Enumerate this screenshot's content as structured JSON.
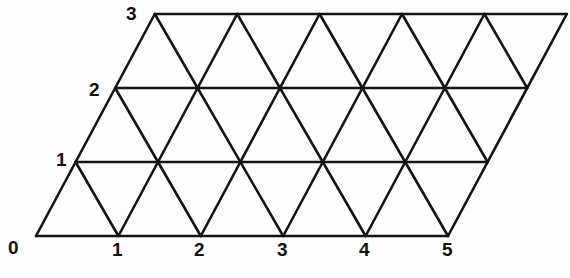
{
  "figure": {
    "name": "triangular-lattice-parallelogram",
    "stroke_color": "#141414",
    "background_color": "#fdfdfd",
    "label_color": "#111111"
  },
  "lattice": {
    "type": "triangular-grid",
    "columns": 5,
    "rows": 3,
    "origin": {
      "x": 36,
      "y": 236
    },
    "step_x": 82.4,
    "step_y": 74.0,
    "shear_x": 39.6,
    "stroke_width": 2.6
  },
  "axes": {
    "x_axis": {
      "name": "horizontal-axis",
      "ticks": [
        {
          "value": "0",
          "x": 36,
          "y": 236
        },
        {
          "value": "1",
          "x": 118,
          "y": 236
        },
        {
          "value": "2",
          "x": 201,
          "y": 236
        },
        {
          "value": "3",
          "x": 283,
          "y": 236
        },
        {
          "value": "4",
          "x": 366,
          "y": 236
        },
        {
          "value": "5",
          "x": 448,
          "y": 236
        }
      ]
    },
    "y_axis": {
      "name": "oblique-axis",
      "ticks": [
        {
          "value": "0",
          "x": 36,
          "y": 236
        },
        {
          "value": "1",
          "x": 76,
          "y": 162
        },
        {
          "value": "2",
          "x": 115,
          "y": 88
        },
        {
          "value": "3",
          "x": 155,
          "y": 14
        }
      ]
    }
  },
  "labels": {
    "origin": {
      "text": "0",
      "left": 8,
      "top": 238
    },
    "x1": {
      "text": "1",
      "left": 112,
      "top": 240
    },
    "x2": {
      "text": "2",
      "left": 194,
      "top": 240
    },
    "x3": {
      "text": "3",
      "left": 277,
      "top": 240
    },
    "x4": {
      "text": "4",
      "left": 359,
      "top": 240
    },
    "x5": {
      "text": "5",
      "left": 442,
      "top": 240
    },
    "y1": {
      "text": "1",
      "left": 56,
      "top": 150
    },
    "y2": {
      "text": "2",
      "left": 89,
      "top": 80
    },
    "y3": {
      "text": "3",
      "left": 126,
      "top": 4
    }
  }
}
